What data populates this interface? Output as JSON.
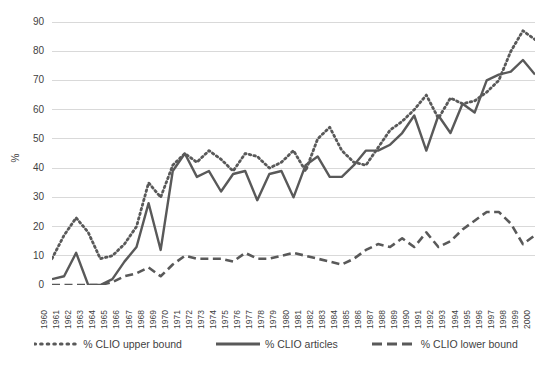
{
  "chart_data": {
    "type": "line",
    "title": "",
    "xlabel": "",
    "ylabel": "%",
    "ylim": [
      0,
      90
    ],
    "yticks": [
      0,
      10,
      20,
      30,
      40,
      50,
      60,
      70,
      80,
      90
    ],
    "grid": true,
    "legend_position": "bottom",
    "categories": [
      "1960",
      "1961",
      "1962",
      "1963",
      "1964",
      "1965",
      "1966",
      "1967",
      "1968",
      "1969",
      "1970",
      "1971",
      "1972",
      "1973",
      "1974",
      "1975",
      "1976",
      "1977",
      "1978",
      "1979",
      "1980",
      "1981",
      "1982",
      "1983",
      "1984",
      "1985",
      "1986",
      "1987",
      "1988",
      "1989",
      "1990",
      "1991",
      "1992",
      "1993",
      "1994",
      "1995",
      "1996",
      "1997",
      "1998",
      "1999",
      "2000"
    ],
    "series": [
      {
        "name": "% CLIO upper bound",
        "style": "dotted",
        "color": "#595959",
        "values": [
          9,
          17,
          23,
          18,
          9,
          10,
          14,
          20,
          35,
          30,
          41,
          45,
          42,
          46,
          43,
          39,
          45,
          44,
          40,
          42,
          46,
          39,
          50,
          54,
          46,
          42,
          41,
          47,
          53,
          56,
          60,
          65,
          57,
          64,
          62,
          63,
          66,
          70,
          80,
          87,
          84
        ]
      },
      {
        "name": "% CLIO articles",
        "style": "solid",
        "color": "#595959",
        "values": [
          2,
          3,
          11,
          0,
          0,
          2,
          8,
          13,
          28,
          12,
          39,
          45,
          37,
          39,
          32,
          38,
          39,
          29,
          38,
          39,
          30,
          41,
          44,
          37,
          37,
          41,
          46,
          46,
          48,
          52,
          58,
          46,
          58,
          52,
          62,
          59,
          70,
          72,
          73,
          77,
          72
        ]
      },
      {
        "name": "% CLIO lower bound",
        "style": "dashed",
        "color": "#595959",
        "values": [
          0,
          0,
          0,
          0,
          0,
          1,
          3,
          4,
          6,
          3,
          7,
          10,
          9,
          9,
          9,
          8,
          11,
          9,
          9,
          10,
          11,
          10,
          9,
          8,
          7,
          9,
          12,
          14,
          13,
          16,
          13,
          18,
          13,
          15,
          19,
          22,
          25,
          25,
          21,
          14,
          17
        ]
      }
    ]
  },
  "legend": {
    "items": [
      {
        "label": "% CLIO upper bound"
      },
      {
        "label": "% CLIO articles"
      },
      {
        "label": "% CLIO lower bound"
      }
    ]
  }
}
